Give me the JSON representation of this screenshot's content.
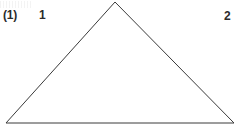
{
  "figure": {
    "caption_label": "(1)",
    "background_color": "#ffffff",
    "stroke_color": "#3a3a3a",
    "stroke_width": 1,
    "width": 241,
    "height": 131,
    "shape": {
      "name": "triangle",
      "type": "isosceles-triangle",
      "points": "115,2 234,123 6,123",
      "apex": {
        "x": 115,
        "y": 2
      },
      "bottom_left": {
        "x": 6,
        "y": 123
      },
      "bottom_right": {
        "x": 234,
        "y": 123
      }
    },
    "labels": [
      {
        "id": "figure-number",
        "text": "(1)",
        "x": 3,
        "y": 9
      },
      {
        "id": "part-1",
        "text": "1",
        "x": 39,
        "y": 9
      },
      {
        "id": "part-2",
        "text": "2",
        "x": 224,
        "y": 10
      }
    ]
  }
}
